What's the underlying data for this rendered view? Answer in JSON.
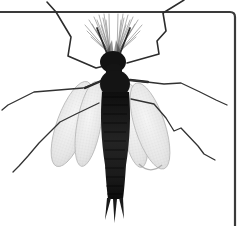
{
  "figure": {
    "alt": "Stipple-engraved black and white illustration of a slender winged insect viewed from above: dark segmented body, plumose antennae, six jointed legs, four pale speckled wings folded downward, and three short tail filaments, set against a thin dark plate frame with a rounded top-right corner"
  },
  "palette": {
    "background": "#ffffff",
    "frame": "#3a3a3a",
    "body": "#141414",
    "head": "#121212",
    "abdomen_mid": "#222222",
    "wing_fill": "#e4e4e4",
    "wing_edge": "#b5b5b5",
    "leg": "#323232",
    "plume": "#7a7a7a"
  }
}
